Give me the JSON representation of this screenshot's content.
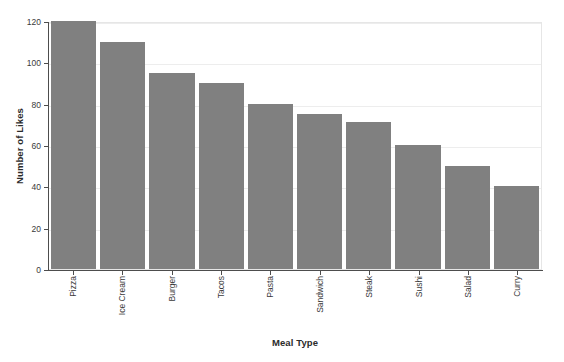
{
  "chart_data": {
    "type": "bar",
    "title": "",
    "xlabel": "Meal Type",
    "ylabel": "Number of Likes",
    "categories": [
      "Pizza",
      "Ice Cream",
      "Burger",
      "Tacos",
      "Pasta",
      "Sandwich",
      "Steak",
      "Sushi",
      "Salad",
      "Curry"
    ],
    "values": [
      120,
      110,
      95,
      90,
      80,
      75,
      71,
      60,
      50,
      40
    ],
    "ylim": [
      0,
      120
    ],
    "yticks": [
      0,
      20,
      40,
      60,
      80,
      100,
      120
    ],
    "ytick_labels": [
      "0",
      "20",
      "40",
      "60",
      "80",
      "100",
      "120"
    ],
    "grid": true,
    "grid_axis": "y",
    "legend": false,
    "bar_color": "#808080",
    "background_color": "#ffffff",
    "gridline_color": "#ededed",
    "axis_color": "#4d4d4d",
    "tick_label_color": "#3a3a3a",
    "axis_title_color": "#2b2b2b",
    "xtick_rotation": 90
  }
}
